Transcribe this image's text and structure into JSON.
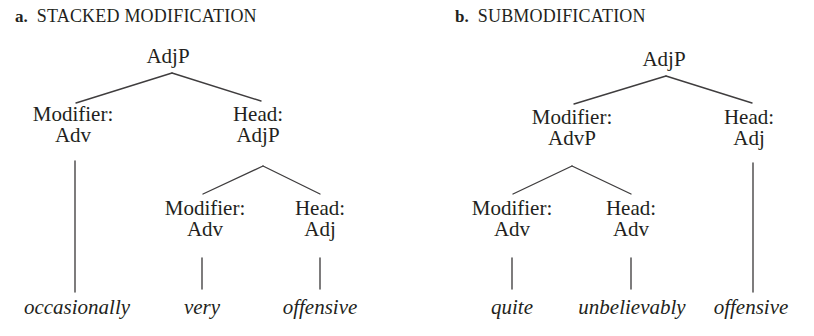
{
  "figure": {
    "background_color": "#ffffff",
    "text_color": "#231f20",
    "line_color": "#3f3d3e"
  },
  "panels": [
    {
      "letter": "a.",
      "title": "STACKED MODIFICATION",
      "nodes": {
        "root": "AdjP",
        "mod_label": "Modifier:",
        "mod_cat": "Adv",
        "head_label": "Head:",
        "head_cat": "AdjP",
        "inner_mod_label": "Modifier:",
        "inner_mod_cat": "Adv",
        "inner_head_label": "Head:",
        "inner_head_cat": "Adj"
      },
      "leaves": {
        "leaf1": "occasionally",
        "leaf2": "very",
        "leaf3": "offensive"
      }
    },
    {
      "letter": "b.",
      "title": "SUBMODIFICATION",
      "nodes": {
        "root": "AdjP",
        "mod_label": "Modifier:",
        "mod_cat": "AdvP",
        "head_label": "Head:",
        "head_cat": "Adj",
        "inner_mod_label": "Modifier:",
        "inner_mod_cat": "Adv",
        "inner_head_label": "Head:",
        "inner_head_cat": "Adv"
      },
      "leaves": {
        "leaf1": "quite",
        "leaf2": "unbelievably",
        "leaf3": "offensive"
      }
    }
  ]
}
